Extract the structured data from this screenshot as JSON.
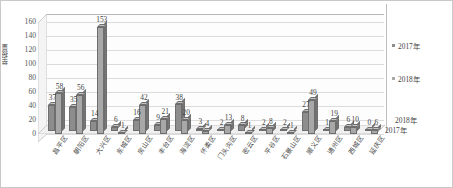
{
  "chart_data": {
    "type": "bar",
    "title": "",
    "xlabel": "",
    "ylabel": "举报量",
    "ylim": [
      0,
      160
    ],
    "ytick_step": 20,
    "yticks": [
      160,
      140,
      120,
      100,
      80,
      60,
      40,
      20,
      0
    ],
    "grid": true,
    "legend_position": "right",
    "three_d": true,
    "categories": [
      "昌平区",
      "朝阳区",
      "大兴区",
      "东城区",
      "房山区",
      "丰台区",
      "海淀区",
      "怀柔区",
      "门头沟区",
      "密云区",
      "平谷区",
      "石景山区",
      "顺义区",
      "通州区",
      "西城区",
      "延庆区"
    ],
    "series": [
      {
        "name": "2017年",
        "color": "#8d8d8d",
        "values": [
          37,
          35,
          14,
          6,
          16,
          9,
          38,
          3,
          2,
          8,
          2,
          2,
          27,
          1,
          6,
          0
        ]
      },
      {
        "name": "2018年",
        "color": "#a8a8a8",
        "values": [
          58,
          56,
          153,
          1,
          42,
          21,
          20,
          4,
          13,
          1,
          8,
          1,
          49,
          19,
          10,
          6
        ]
      }
    ],
    "depth_axis_labels": [
      "2018年",
      "2017年"
    ]
  },
  "legend": {
    "items": [
      {
        "label": "2017年"
      },
      {
        "label": "2018年"
      }
    ]
  }
}
